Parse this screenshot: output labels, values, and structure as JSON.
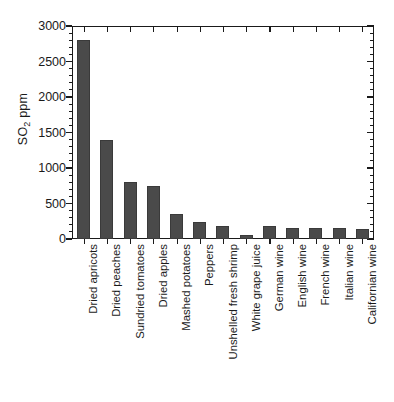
{
  "chart_data": {
    "type": "bar",
    "title": "",
    "subtitle": "",
    "xlabel": "",
    "ylabel": "SO2 ppm",
    "ylabel_parts": {
      "prefix": "SO",
      "sub": "2",
      "suffix": " ppm"
    },
    "ylim": [
      0,
      3000
    ],
    "yticks": [
      0,
      500,
      1000,
      1500,
      2000,
      2500,
      3000
    ],
    "ytick_labels": [
      "0",
      "500",
      "1000",
      "1500",
      "2000",
      "2500",
      "3000"
    ],
    "minor_tick_interval": 100,
    "grid": false,
    "legend": null,
    "bar_color": "#4a4a4a",
    "axis_color": "#1a1a1a",
    "background": "#ffffff",
    "categories": [
      "Dried apricots",
      "Dried peaches",
      "Sundried tomatoes",
      "Dried apples",
      "Mashed potatoes",
      "Peppers",
      "Unshelled fresh shrimp",
      "White grape juice",
      "German wine",
      "English wine",
      "French wine",
      "Italian wine",
      "Californian wine"
    ],
    "values": [
      2800,
      1400,
      800,
      750,
      350,
      240,
      185,
      50,
      180,
      155,
      150,
      150,
      135
    ],
    "units": "ppm"
  }
}
